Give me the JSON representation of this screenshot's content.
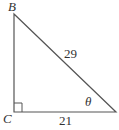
{
  "diagram": {
    "type": "right-triangle",
    "vertices": {
      "B": {
        "label": "B"
      },
      "C": {
        "label": "C"
      }
    },
    "sides": {
      "hypotenuse": {
        "label": "29"
      },
      "base": {
        "label": "21"
      }
    },
    "angle": {
      "label": "θ"
    },
    "right_angle_at": "C",
    "colors": {
      "stroke": "#555555",
      "text": "#333333"
    }
  }
}
